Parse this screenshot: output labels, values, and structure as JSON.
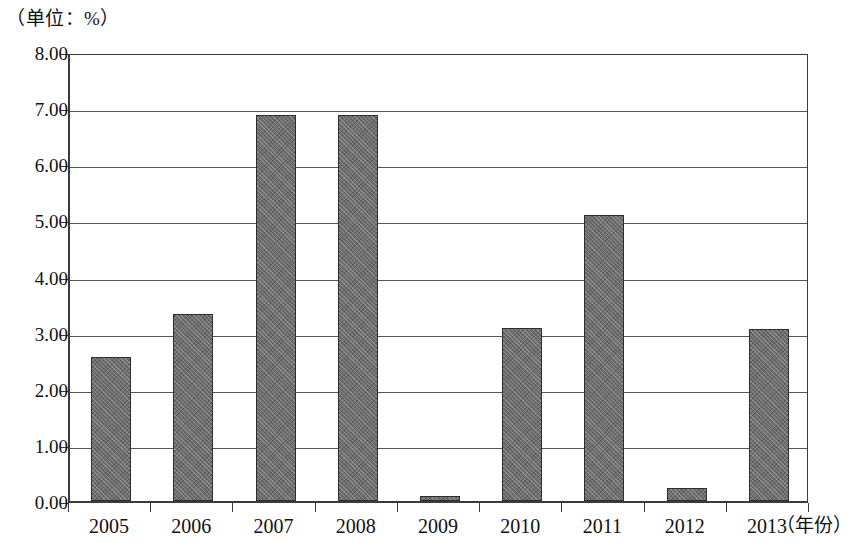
{
  "chart_data": {
    "type": "bar",
    "title": "",
    "subtitle": "",
    "unit_caption": "（单位：%）",
    "xlabel": "（年份）",
    "ylabel": "",
    "categories": [
      "2005",
      "2006",
      "2007",
      "2008",
      "2009",
      "2010",
      "2011",
      "2012",
      "2013"
    ],
    "values": [
      2.57,
      3.33,
      6.88,
      6.88,
      0.09,
      3.09,
      5.09,
      0.24,
      3.07
    ],
    "series": [
      {
        "name": "",
        "values": [
          2.57,
          3.33,
          6.88,
          6.88,
          0.09,
          3.09,
          5.09,
          0.24,
          3.07
        ]
      }
    ],
    "ylim": [
      0,
      8
    ],
    "ytick_step": 1,
    "ytick_labels": [
      "8.00",
      "7.00",
      "6.00",
      "5.00",
      "4.00",
      "3.00",
      "2.00",
      "1.00",
      "0.00"
    ],
    "ytick_values": [
      8,
      7,
      6,
      5,
      4,
      3,
      2,
      1,
      0
    ],
    "grid": true,
    "grid_axis": "y",
    "legend": false,
    "legend_position": "none",
    "bar_color": "#6e6e6e",
    "bar_edge_color": "#2e2e2e",
    "axis_color": "#3b3b3b",
    "background_color": "#ffffff"
  }
}
